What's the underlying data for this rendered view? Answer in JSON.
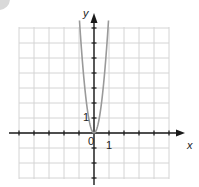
{
  "chart_data": {
    "type": "line",
    "title": "",
    "xlabel": "x",
    "ylabel": "y",
    "xlim": [
      -5,
      5
    ],
    "ylim": [
      -3,
      7
    ],
    "grid": true,
    "legend": null,
    "tick_labels": {
      "x": [
        "1"
      ],
      "y": [
        "1"
      ],
      "origin": "0"
    },
    "series": [
      {
        "name": "parabola",
        "equation": "y = 8x^2",
        "color": "#9a9a9a",
        "x": [
          -0.97,
          -0.8,
          -0.6,
          -0.4,
          -0.2,
          0,
          0.2,
          0.4,
          0.6,
          0.8,
          0.97
        ],
        "y": [
          7.5,
          5.12,
          2.88,
          1.28,
          0.32,
          0,
          0.32,
          1.28,
          2.88,
          5.12,
          7.5
        ]
      }
    ]
  },
  "labels": {
    "x_axis": "x",
    "y_axis": "y",
    "origin": "0",
    "x_tick_one": "1",
    "y_tick_one": "1"
  },
  "colors": {
    "grid": "#d4d4d4",
    "axis": "#1a1a1a",
    "curve": "#9a9a9a",
    "badge": "#d9d9d9"
  }
}
